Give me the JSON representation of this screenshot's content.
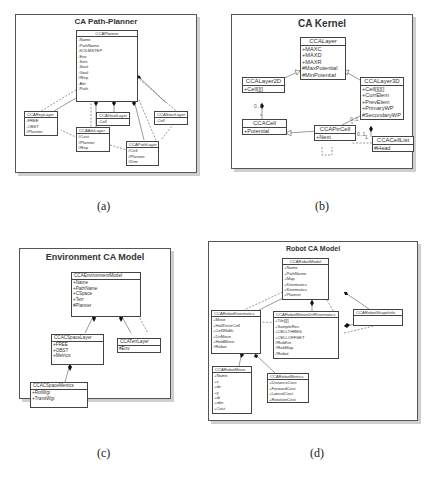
{
  "panels": {
    "a": {
      "caption": "(a)",
      "title": "CA Path-Planner",
      "classes": {
        "planner": {
          "name": "CCAPlanner",
          "attrs": [
            "-Name",
            "-PathName",
            "-KOLMSTEP",
            "-Env",
            "-Size",
            "-Start",
            "-Goal",
            "#Rep",
            "-Attr",
            "-Path"
          ]
        },
        "rep": {
          "name": "CCARepLayer",
          "attrs": [
            "-FREE",
            "-OBST",
            "#Planner"
          ]
        },
        "attr": {
          "name": "CCAAttrLayer",
          "attrs": [
            "#Cost",
            "#Planner",
            "#Rep"
          ]
        },
        "goal": {
          "name": "CCAGoalLayer",
          "attrs": [
            "-Cell"
          ]
        },
        "start": {
          "name": "CCAStartLayer",
          "attrs": [
            "-Cell"
          ]
        },
        "path": {
          "name": "CCAPathLayer",
          "attrs": [
            "#Cell",
            "#Planner",
            "#Dim"
          ]
        }
      }
    },
    "b": {
      "caption": "(b)",
      "title": "CA Kernel",
      "classes": {
        "layer": {
          "name": "CCALayer",
          "attrs": [
            "+MAXC",
            "+MAXD",
            "+MAXR",
            "#MaxPotential",
            "#MinPotential"
          ]
        },
        "layer2d": {
          "name": "CCALayer2D",
          "attrs": [
            "+Cell[][]"
          ]
        },
        "layer3d": {
          "name": "CCALayer3D",
          "attrs": [
            "+Cell[][][]",
            "+CurrElem",
            "+PrevElem",
            "+PrimaryWP",
            "#SecondaryWP"
          ]
        },
        "cell": {
          "name": "CCACell",
          "attrs": [
            "+Potential"
          ]
        },
        "ptrcell": {
          "name": "CCAPtrCell",
          "attrs": [
            "+Next"
          ]
        },
        "celllist": {
          "name": "CCACellList",
          "attrs": [
            "#Head"
          ]
        }
      },
      "multiplicities": [
        "0..1",
        "*",
        "0..1",
        "*",
        "0..1",
        "1",
        "0..1",
        "1"
      ]
    },
    "c": {
      "caption": "(c)",
      "title": "Environment CA Model",
      "classes": {
        "env": {
          "name": "CCAEnvironmentModel",
          "attrs": [
            "+Name",
            "+PathName",
            "+CSpace",
            "+Terr",
            "#Planner"
          ]
        },
        "cspace": {
          "name": "CCACSpaceLayer",
          "attrs": [
            "+FREE",
            "+OBST",
            "+Metrics"
          ]
        },
        "terr": {
          "name": "CCATerrLayer",
          "attrs": [
            "#Env"
          ]
        },
        "metrics": {
          "name": "CCACSpaceMetrics",
          "attrs": [
            "+RotWgt",
            "+TransWgt"
          ]
        }
      }
    },
    "d": {
      "caption": "(d)",
      "title": "Robot CA Model",
      "classes": {
        "robot": {
          "name": "CCARobotModel",
          "attrs": [
            "+Name",
            "+PathName",
            "+Map",
            "+Kinematics",
            "+Kinematics",
            "+Planner"
          ]
        },
        "kin": {
          "name": "CCARobotKinematics",
          "attrs": [
            "+Move",
            "+HalfDriveCell",
            "+CellWidth",
            "+DirMove",
            "+HoldMove",
            "#Robot"
          ]
        },
        "motion": {
          "name": "CCARobotMotionDiffKinematics",
          "attrs": [
            "+Tile[][]",
            "+SampleRes",
            "+CELLTHRES",
            "+CELLOFFSET",
            "#RobKin",
            "#RobMap",
            "#Robot"
          ]
        },
        "shape": {
          "name": "CCARobotShapeInfo",
          "attrs": []
        },
        "move": {
          "name": "CCARobotMove",
          "attrs": [
            "+Name",
            "+x",
            "+dx",
            "+y",
            "+dr",
            "+rdin",
            "+Cost"
          ]
        },
        "rmetrics": {
          "name": "CCARobotMetrics",
          "attrs": [
            "+DistanceCost",
            "+ForwardCost",
            "+LateralCost",
            "+RotationCost"
          ]
        }
      }
    }
  }
}
